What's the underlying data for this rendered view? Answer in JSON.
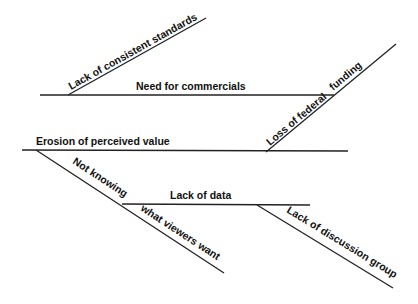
{
  "diagram": {
    "type": "fishbone",
    "labels": {
      "consistent_standards": "Lack of consistent standards",
      "commercials": "Need for commercials",
      "federal_1": "Loss of federal",
      "federal_2": "funding",
      "erosion": "Erosion of perceived value",
      "not_knowing_1": "Not knowing",
      "not_knowing_2": "what viewers want",
      "lack_data": "Lack of data",
      "discussion": "Lack of discussion group"
    }
  }
}
